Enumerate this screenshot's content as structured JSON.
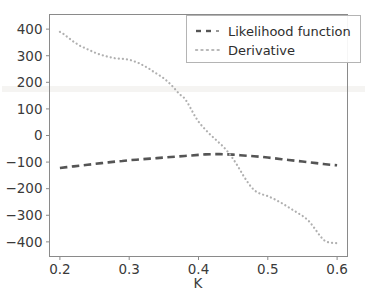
{
  "chart_data": {
    "type": "line",
    "title": "",
    "xlabel": "K",
    "ylabel": "",
    "xlim": [
      0.185,
      0.615
    ],
    "ylim": [
      -455,
      455
    ],
    "grid": false,
    "legend_position": "upper right",
    "xticks": [
      0.2,
      0.3,
      0.4,
      0.5,
      0.6
    ],
    "xtick_labels": [
      "0.2",
      "0.3",
      "0.4",
      "0.5",
      "0.6"
    ],
    "yticks": [
      400,
      300,
      200,
      100,
      0,
      -100,
      -200,
      -300,
      -400
    ],
    "ytick_labels": [
      "400",
      "300",
      "200",
      "100",
      "0",
      "−100",
      "−200",
      "−300",
      "−400"
    ],
    "series": [
      {
        "name": "Likelihood function",
        "style": "dashed",
        "color": "#555555",
        "x": [
          0.2,
          0.21,
          0.22,
          0.23,
          0.24,
          0.25,
          0.26,
          0.27,
          0.28,
          0.29,
          0.3,
          0.31,
          0.32,
          0.33,
          0.34,
          0.35,
          0.36,
          0.37,
          0.38,
          0.39,
          0.4,
          0.41,
          0.42,
          0.43,
          0.44,
          0.45,
          0.46,
          0.47,
          0.48,
          0.49,
          0.5,
          0.51,
          0.52,
          0.53,
          0.54,
          0.55,
          0.56,
          0.57,
          0.58,
          0.59,
          0.6
        ],
        "values": [
          -122,
          -119,
          -116,
          -113,
          -110,
          -107,
          -104,
          -101,
          -98,
          -96,
          -93,
          -91,
          -89,
          -87,
          -85,
          -83,
          -81,
          -79,
          -77,
          -75,
          -73,
          -71,
          -70,
          -70,
          -71,
          -72,
          -74,
          -76,
          -78,
          -80,
          -83,
          -86,
          -89,
          -92,
          -95,
          -98,
          -101,
          -104,
          -107,
          -110,
          -112
        ]
      },
      {
        "name": "Derivative",
        "style": "dotted",
        "color": "#b0b0b0",
        "x": [
          0.2,
          0.205,
          0.21,
          0.215,
          0.22,
          0.225,
          0.23,
          0.235,
          0.24,
          0.245,
          0.25,
          0.255,
          0.26,
          0.265,
          0.27,
          0.275,
          0.28,
          0.285,
          0.29,
          0.295,
          0.3,
          0.305,
          0.31,
          0.315,
          0.32,
          0.325,
          0.33,
          0.335,
          0.34,
          0.345,
          0.35,
          0.355,
          0.36,
          0.365,
          0.37,
          0.375,
          0.38,
          0.385,
          0.39,
          0.395,
          0.4,
          0.405,
          0.41,
          0.415,
          0.42,
          0.425,
          0.43,
          0.435,
          0.44,
          0.445,
          0.45,
          0.455,
          0.46,
          0.465,
          0.47,
          0.475,
          0.48,
          0.485,
          0.49,
          0.495,
          0.5,
          0.505,
          0.51,
          0.515,
          0.52,
          0.525,
          0.53,
          0.535,
          0.54,
          0.545,
          0.55,
          0.555,
          0.56,
          0.565,
          0.57,
          0.575,
          0.58,
          0.585,
          0.59,
          0.595,
          0.6
        ],
        "values": [
          390,
          382,
          372,
          362,
          352,
          344,
          336,
          330,
          324,
          318,
          312,
          307,
          303,
          299,
          296,
          293,
          290,
          289,
          288,
          287,
          285,
          281,
          276,
          271,
          264,
          257,
          249,
          240,
          232,
          224,
          215,
          204,
          192,
          178,
          163,
          150,
          140,
          120,
          96,
          72,
          52,
          36,
          22,
          8,
          -4,
          -16,
          -28,
          -40,
          -54,
          -70,
          -88,
          -108,
          -130,
          -152,
          -172,
          -190,
          -205,
          -214,
          -220,
          -224,
          -228,
          -234,
          -240,
          -247,
          -254,
          -262,
          -270,
          -278,
          -286,
          -294,
          -302,
          -312,
          -324,
          -340,
          -358,
          -376,
          -392,
          -400,
          -403,
          -404,
          -405
        ]
      }
    ]
  },
  "legend": {
    "entries": [
      {
        "label": "Likelihood function"
      },
      {
        "label": "Derivative"
      }
    ]
  }
}
